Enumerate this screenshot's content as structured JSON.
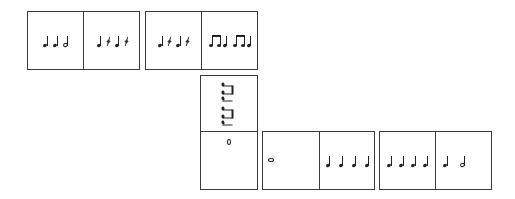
{
  "colors": {
    "border": "#3a3a3a",
    "ink": "#222222",
    "background": "#ffffff"
  },
  "tiles": [
    {
      "id": "tile-1",
      "orientation": "horizontal",
      "halves": [
        {
          "rhythm": [
            "quarter",
            "quarter",
            "half"
          ]
        },
        {
          "rhythm": [
            "quarter",
            "quarter-rest",
            "quarter",
            "quarter-rest"
          ]
        }
      ]
    },
    {
      "id": "tile-2",
      "orientation": "horizontal",
      "halves": [
        {
          "rhythm": [
            "quarter",
            "quarter-rest",
            "quarter",
            "quarter-rest"
          ]
        },
        {
          "rhythm": [
            "eighth-pair",
            "quarter",
            "eighth-pair",
            "quarter"
          ]
        }
      ]
    },
    {
      "id": "tile-3",
      "orientation": "vertical",
      "halves": [
        {
          "rhythm": [
            "eighth-pair",
            "quarter",
            "eighth-pair",
            "quarter"
          ],
          "rotated": true
        },
        {
          "rhythm": [
            "whole"
          ]
        }
      ]
    },
    {
      "id": "tile-4",
      "orientation": "horizontal",
      "halves": [
        {
          "rhythm": [
            "whole"
          ]
        },
        {
          "rhythm": [
            "quarter",
            "quarter",
            "quarter",
            "quarter"
          ]
        }
      ]
    },
    {
      "id": "tile-5",
      "orientation": "horizontal",
      "halves": [
        {
          "rhythm": [
            "quarter",
            "quarter",
            "quarter",
            "quarter"
          ]
        },
        {
          "rhythm": [
            "quarter",
            "half"
          ]
        }
      ]
    }
  ]
}
